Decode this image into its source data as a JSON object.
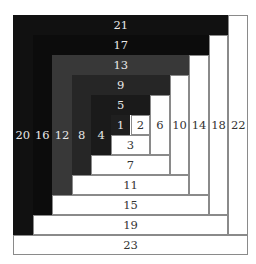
{
  "grid_size": 12,
  "center_cell": {
    "col": 5,
    "row": 5
  },
  "pieces": [
    {
      "label": "1",
      "tone": "dark",
      "fill": "#1f1f1f",
      "col": 5,
      "row": 5,
      "cols": 1,
      "rows": 1
    },
    {
      "label": "2",
      "tone": "light",
      "fill": "#ffffff",
      "col": 6,
      "row": 5,
      "cols": 1,
      "rows": 1
    },
    {
      "label": "3",
      "tone": "light",
      "fill": "#ffffff",
      "col": 5,
      "row": 6,
      "cols": 2,
      "rows": 1
    },
    {
      "label": "4",
      "tone": "dark",
      "fill": "#1a1a1a",
      "col": 4,
      "row": 5,
      "cols": 1,
      "rows": 2
    },
    {
      "label": "5",
      "tone": "dark",
      "fill": "#1a1a1a",
      "col": 4,
      "row": 4,
      "cols": 3,
      "rows": 1
    },
    {
      "label": "6",
      "tone": "light",
      "fill": "#ffffff",
      "col": 7,
      "row": 4,
      "cols": 1,
      "rows": 3
    },
    {
      "label": "7",
      "tone": "light",
      "fill": "#ffffff",
      "col": 4,
      "row": 7,
      "cols": 4,
      "rows": 1
    },
    {
      "label": "8",
      "tone": "dark",
      "fill": "#262626",
      "col": 3,
      "row": 4,
      "cols": 1,
      "rows": 4
    },
    {
      "label": "9",
      "tone": "dark",
      "fill": "#262626",
      "col": 3,
      "row": 3,
      "cols": 5,
      "rows": 1
    },
    {
      "label": "10",
      "tone": "light",
      "fill": "#ffffff",
      "col": 8,
      "row": 3,
      "cols": 1,
      "rows": 5
    },
    {
      "label": "11",
      "tone": "light",
      "fill": "#ffffff",
      "col": 3,
      "row": 8,
      "cols": 6,
      "rows": 1
    },
    {
      "label": "12",
      "tone": "dark",
      "fill": "#383838",
      "col": 2,
      "row": 3,
      "cols": 1,
      "rows": 6
    },
    {
      "label": "13",
      "tone": "dark",
      "fill": "#383838",
      "col": 2,
      "row": 2,
      "cols": 7,
      "rows": 1
    },
    {
      "label": "14",
      "tone": "light",
      "fill": "#ffffff",
      "col": 9,
      "row": 2,
      "cols": 1,
      "rows": 7
    },
    {
      "label": "15",
      "tone": "light",
      "fill": "#ffffff",
      "col": 2,
      "row": 9,
      "cols": 8,
      "rows": 1
    },
    {
      "label": "16",
      "tone": "dark",
      "fill": "#0c0c0c",
      "col": 1,
      "row": 2,
      "cols": 1,
      "rows": 8
    },
    {
      "label": "17",
      "tone": "dark",
      "fill": "#0c0c0c",
      "col": 1,
      "row": 1,
      "cols": 9,
      "rows": 1
    },
    {
      "label": "18",
      "tone": "light",
      "fill": "#ffffff",
      "col": 10,
      "row": 1,
      "cols": 1,
      "rows": 9
    },
    {
      "label": "19",
      "tone": "light",
      "fill": "#ffffff",
      "col": 1,
      "row": 10,
      "cols": 10,
      "rows": 1
    },
    {
      "label": "20",
      "tone": "dark",
      "fill": "#111111",
      "col": 0,
      "row": 1,
      "cols": 1,
      "rows": 10
    },
    {
      "label": "21",
      "tone": "dark",
      "fill": "#111111",
      "col": 0,
      "row": 0,
      "cols": 11,
      "rows": 1
    },
    {
      "label": "22",
      "tone": "light",
      "fill": "#ffffff",
      "col": 11,
      "row": 0,
      "cols": 1,
      "rows": 11
    },
    {
      "label": "23",
      "tone": "light",
      "fill": "#ffffff",
      "col": 0,
      "row": 11,
      "cols": 12,
      "rows": 1
    }
  ]
}
